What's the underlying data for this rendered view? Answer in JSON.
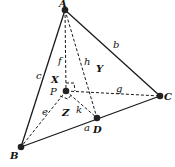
{
  "diagram": {
    "type": "tetrahedron",
    "points": {
      "A": {
        "label": "A",
        "x": 65,
        "y": 10
      },
      "B": {
        "label": "B",
        "x": 21,
        "y": 147
      },
      "C": {
        "label": "C",
        "x": 160,
        "y": 96
      },
      "D": {
        "label": "D",
        "x": 97,
        "y": 118
      },
      "P": {
        "label": "P",
        "x": 66,
        "y": 91
      }
    },
    "edge_labels": {
      "a": "a",
      "b": "b",
      "c": "c",
      "e": "e",
      "f": "f",
      "g": "g",
      "h": "h",
      "k": "k"
    },
    "face_labels": {
      "X": "X",
      "Y": "Y",
      "Z": "Z"
    },
    "colors": {
      "line": "#1a1a1a",
      "point": "#222222"
    }
  }
}
